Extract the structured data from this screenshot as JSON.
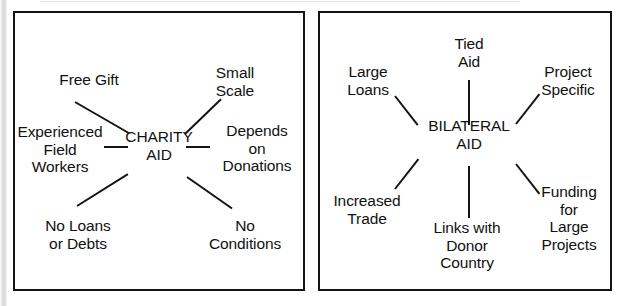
{
  "diagram": {
    "type": "two-panel spider diagram comparing aid types",
    "panels": [
      {
        "id": "charity-aid",
        "center": {
          "label": "CHARITY\nAID"
        },
        "nodes": [
          {
            "label": "Free Gift"
          },
          {
            "label": "Small Scale"
          },
          {
            "label": "Experienced\nField\nWorkers"
          },
          {
            "label": "Depends on\nDonations"
          },
          {
            "label": "No Loans\nor Debts"
          },
          {
            "label": "No Conditions"
          }
        ]
      },
      {
        "id": "bilateral-aid",
        "center": {
          "label": "BILATERAL\nAID"
        },
        "nodes": [
          {
            "label": "Tied\nAid"
          },
          {
            "label": "Large\nLoans"
          },
          {
            "label": "Project\nSpecific"
          },
          {
            "label": "Increased\nTrade"
          },
          {
            "label": "Funding for\nLarge\nProjects"
          },
          {
            "label": "Links with\nDonor\nCountry"
          }
        ]
      }
    ]
  },
  "colors": {
    "ink": "#111111",
    "border": "#141414",
    "background": "#ffffff"
  }
}
